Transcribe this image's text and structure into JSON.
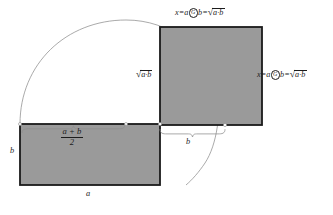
{
  "figure": {
    "colors": {
      "shape_fill": "#9a9a9a",
      "shape_stroke": "#1a1a1a",
      "arc_stroke": "#8d8d8d",
      "brace_stroke": "#8d8d8d",
      "text": "#1c1c1c",
      "background": "#ffffff"
    },
    "geometry": {
      "rectangle": {
        "x": 20,
        "y": 124,
        "width": 140,
        "height": 61,
        "fill": "#9a9a9a",
        "stroke_width": 1.8
      },
      "square": {
        "x": 160,
        "y": 27,
        "width": 102,
        "height": 98,
        "fill": "#9a9a9a",
        "stroke_width": 1.8
      },
      "arc": {
        "start_x": 20,
        "start_y": 124,
        "apex_x": 126,
        "apex_y": 20,
        "end_x": 186,
        "end_y": 185,
        "stroke_width": 0.7
      }
    }
  },
  "labels": {
    "top_equation": {
      "lhs": "x",
      "equals": "=",
      "operand_left": "a",
      "operator_glyph": "G",
      "operand_right": "b",
      "equals_2": "=",
      "radicand": "a·b"
    },
    "right_equation": {
      "lhs": "x",
      "equals": "=",
      "operand_left": "a",
      "operator_glyph": "G",
      "operand_right": "b",
      "equals_2": "=",
      "radicand": "a·b"
    },
    "center_radical": {
      "radicand": "a·b"
    },
    "arithmetic_mean": {
      "numerator": "a + b",
      "denominator": "2"
    },
    "brace_b": "b",
    "side_b": "b",
    "bottom_a": "a"
  }
}
